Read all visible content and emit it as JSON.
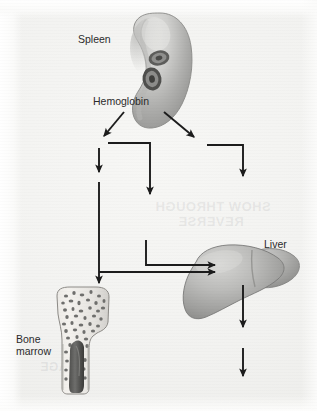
{
  "figure": {
    "background_color": "#f2f2f0",
    "ink_color": "#1c1c1c"
  },
  "labels": {
    "spleen": "Spleen",
    "hemoglobin": "Hemoglobin",
    "liver": "Liver",
    "bone_marrow": "Bone\nmarrow"
  },
  "organs": [
    {
      "name": "spleen",
      "label": "Spleen",
      "shape": "bean",
      "fill_light": "#d8d8d6",
      "fill_dark": "#8e8e8c",
      "inclusions": 2,
      "inclusion_note": "two dark ring-shaped red blood cells"
    },
    {
      "name": "liver",
      "label": "Liver",
      "shape": "two-lobed",
      "fill_light": "#c9c9c7",
      "fill_dark": "#828280"
    },
    {
      "name": "bone-marrow",
      "label": "Bone\nmarrow",
      "shape": "long-bone-cutaway",
      "fill_light": "#f0efec",
      "fill_dark": "#585856",
      "texture": "trabecular-spongy",
      "cavity_note": "dark central marrow cavity"
    }
  ],
  "arrows": [
    {
      "id": "hb-to-left",
      "type": "diagonal",
      "from": "hemoglobin",
      "to": "left-branch"
    },
    {
      "id": "hb-to-right",
      "type": "diagonal",
      "from": "hemoglobin",
      "to": "right-branch"
    },
    {
      "id": "left-down-short",
      "type": "vertical",
      "from": "left-branch",
      "to": "downstream"
    },
    {
      "id": "elbow-mid",
      "type": "elbow",
      "from": "left-branch",
      "to": "mid-down"
    },
    {
      "id": "elbow-right",
      "type": "elbow",
      "from": "right-branch",
      "to": "right-down"
    },
    {
      "id": "left-long-down",
      "type": "vertical",
      "from": "left-branch",
      "to": "bone-marrow"
    },
    {
      "id": "mid-elbow-liver",
      "type": "elbow",
      "from": "mid-down",
      "to": "liver"
    },
    {
      "id": "left-to-liver",
      "type": "horizontal",
      "from": "left-trunk",
      "to": "liver"
    },
    {
      "id": "liver-down-1",
      "type": "vertical",
      "from": "liver",
      "to": "downstream"
    },
    {
      "id": "liver-down-2",
      "type": "vertical",
      "from": "downstream",
      "to": "excretion"
    }
  ],
  "showthrough": {
    "line1": "SHOW THROUGH",
    "line2": "REVERSE",
    "line3": "PAGE"
  }
}
